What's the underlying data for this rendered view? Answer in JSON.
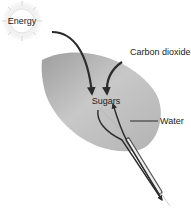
{
  "diagram": {
    "labels": {
      "energy": "Energy",
      "carbon_dioxide": "Carbon dioxide",
      "sugars": "Sugars",
      "water": "Water"
    },
    "icons": {
      "sun": "sun-icon",
      "leaf": "leaf-icon"
    },
    "colors": {
      "leaf_light": "#d4d4d4",
      "leaf_dark": "#a9a9a9",
      "arrow": "#2b2b2b",
      "sun_glow": "#e6e6e6",
      "text": "#222222"
    }
  }
}
